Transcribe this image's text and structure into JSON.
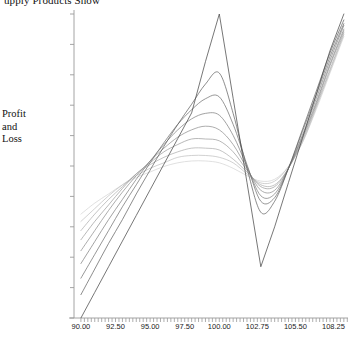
{
  "chart_data": {
    "type": "line",
    "title": "upply Products Show",
    "xlabel": "",
    "ylabel": "Profit and Loss",
    "ylabel_lines": [
      "Profit",
      "and",
      "Loss"
    ],
    "xlim": [
      89.5,
      109.3
    ],
    "ylim": [
      -59741,
      106259
    ],
    "grid": false,
    "legend": "none",
    "xtick_labels": [
      "90.00",
      "92.50",
      "95.00",
      "97.50",
      "100.00",
      "102.75",
      "105.50",
      "108.25"
    ],
    "xtick_values": [
      90.0,
      92.5,
      95.0,
      97.5,
      100.0,
      102.75,
      105.5,
      108.25
    ],
    "ytick_labels": [
      "106259",
      "89659",
      "73059",
      "56459",
      "39859",
      "23259",
      "6659",
      "-9941",
      "-26541",
      "-43141",
      "-59741"
    ],
    "ytick_values": [
      106259,
      89659,
      73059,
      56459,
      39859,
      23259,
      6659,
      -9941,
      -26541,
      -43141,
      -59741
    ],
    "minor_xticks": true,
    "line_color_light": "#d8d8d8",
    "line_color_dark": "#3c3c3c",
    "axis_color": "#9a9a9a",
    "x": [
      90.0,
      91.0,
      92.0,
      93.0,
      94.0,
      95.0,
      96.0,
      97.0,
      98.0,
      99.0,
      100.0,
      101.0,
      102.0,
      103.0,
      104.0,
      105.0,
      106.0,
      107.0,
      108.0,
      109.0
    ],
    "series": [
      {
        "name": "expiry",
        "color": "#4a4a4a",
        "values": [
          -59741,
          -45741,
          -31741,
          -17741,
          -3741,
          10259,
          24259,
          38259,
          52259,
          80259,
          106259,
          60259,
          14259,
          -31741,
          -9941,
          14259,
          38259,
          62259,
          86259,
          106259
        ]
      },
      {
        "name": "t1",
        "color": "#5a5a5a",
        "values": [
          -47000,
          -33000,
          -19000,
          -6000,
          8000,
          21000,
          34000,
          46000,
          57000,
          68000,
          74000,
          52000,
          22000,
          -2000,
          4000,
          22000,
          43000,
          64000,
          85000,
          103000
        ]
      },
      {
        "name": "t2",
        "color": "#6a6a6a",
        "values": [
          -38000,
          -25000,
          -12000,
          1000,
          13000,
          25000,
          36000,
          46000,
          54000,
          60000,
          61000,
          46000,
          24000,
          4000,
          6000,
          22000,
          42000,
          62000,
          83000,
          101000
        ]
      },
      {
        "name": "t3",
        "color": "#7a7a7a",
        "values": [
          -30000,
          -18000,
          -6000,
          5000,
          16000,
          26000,
          35000,
          43000,
          49000,
          52000,
          51000,
          40000,
          23000,
          7000,
          8000,
          22000,
          40000,
          60000,
          81000,
          100000
        ]
      },
      {
        "name": "t4",
        "color": "#8a8a8a",
        "values": [
          -23000,
          -12000,
          -1000,
          9000,
          18000,
          26000,
          33000,
          39000,
          43000,
          45000,
          43000,
          35000,
          22000,
          10000,
          10000,
          22000,
          39000,
          58000,
          79000,
          98000
        ]
      },
      {
        "name": "t5",
        "color": "#9a9a9a",
        "values": [
          -17000,
          -7000,
          2000,
          11000,
          19000,
          25000,
          31000,
          35000,
          38000,
          38000,
          37000,
          31000,
          21000,
          12000,
          12000,
          22000,
          38000,
          57000,
          78000,
          97000
        ]
      },
      {
        "name": "t6",
        "color": "#aaaaaa",
        "values": [
          -12000,
          -3000,
          5000,
          12000,
          19000,
          24000,
          28000,
          31000,
          33000,
          33000,
          32000,
          27000,
          20000,
          13000,
          13000,
          22000,
          37000,
          56000,
          76000,
          96000
        ]
      },
      {
        "name": "t7",
        "color": "#bdbdbd",
        "values": [
          -7000,
          0,
          7000,
          13000,
          18000,
          22000,
          25000,
          28000,
          29000,
          29000,
          28000,
          25000,
          19000,
          14000,
          15000,
          23000,
          36000,
          55000,
          75000,
          95000
        ]
      },
      {
        "name": "t8",
        "color": "#d2d2d2",
        "values": [
          -3000,
          3000,
          8000,
          13000,
          17000,
          20000,
          23000,
          25000,
          26000,
          26000,
          25000,
          22000,
          18000,
          15000,
          16000,
          23000,
          36000,
          54000,
          74000,
          94000
        ]
      }
    ]
  }
}
